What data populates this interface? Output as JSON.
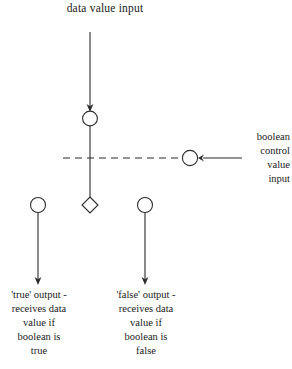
{
  "diagram": {
    "title": "data value input",
    "boolean_input_label": "boolean\ncontrol\nvalue\ninput",
    "true_output_label": "'true' output -\nreceives data\nvalue if\nboolean is\ntrue",
    "false_output_label": "'false' output -\nreceives data\nvalue if\nboolean is\nfalse",
    "colors": {
      "stroke": "#2b2b2b",
      "text": "#1a1a1a",
      "background": "#ffffff"
    },
    "geometry": {
      "data_input_arrow": {
        "x": 90,
        "y1": 32,
        "y2": 110
      },
      "data_node_circle": {
        "cx": 90,
        "cy": 118,
        "r": 7.5
      },
      "spine_line": {
        "x": 90,
        "y1": 125,
        "y2": 197
      },
      "dashed_line": {
        "y": 158,
        "x1": 63,
        "x2": 183
      },
      "boolean_circle": {
        "cx": 190,
        "cy": 158,
        "r": 7.5
      },
      "boolean_arrow": {
        "y": 158,
        "x1": 242,
        "x2": 200
      },
      "decision_diamond": {
        "cx": 90,
        "cy": 205,
        "half": 8
      },
      "true_output_circle": {
        "cx": 38,
        "cy": 205,
        "r": 7.5
      },
      "true_output_arrow": {
        "x": 38,
        "y1": 213,
        "y2": 283
      },
      "false_output_circle": {
        "cx": 145,
        "cy": 205,
        "r": 7.5
      },
      "false_output_arrow": {
        "x": 145,
        "y1": 213,
        "y2": 283
      }
    }
  }
}
